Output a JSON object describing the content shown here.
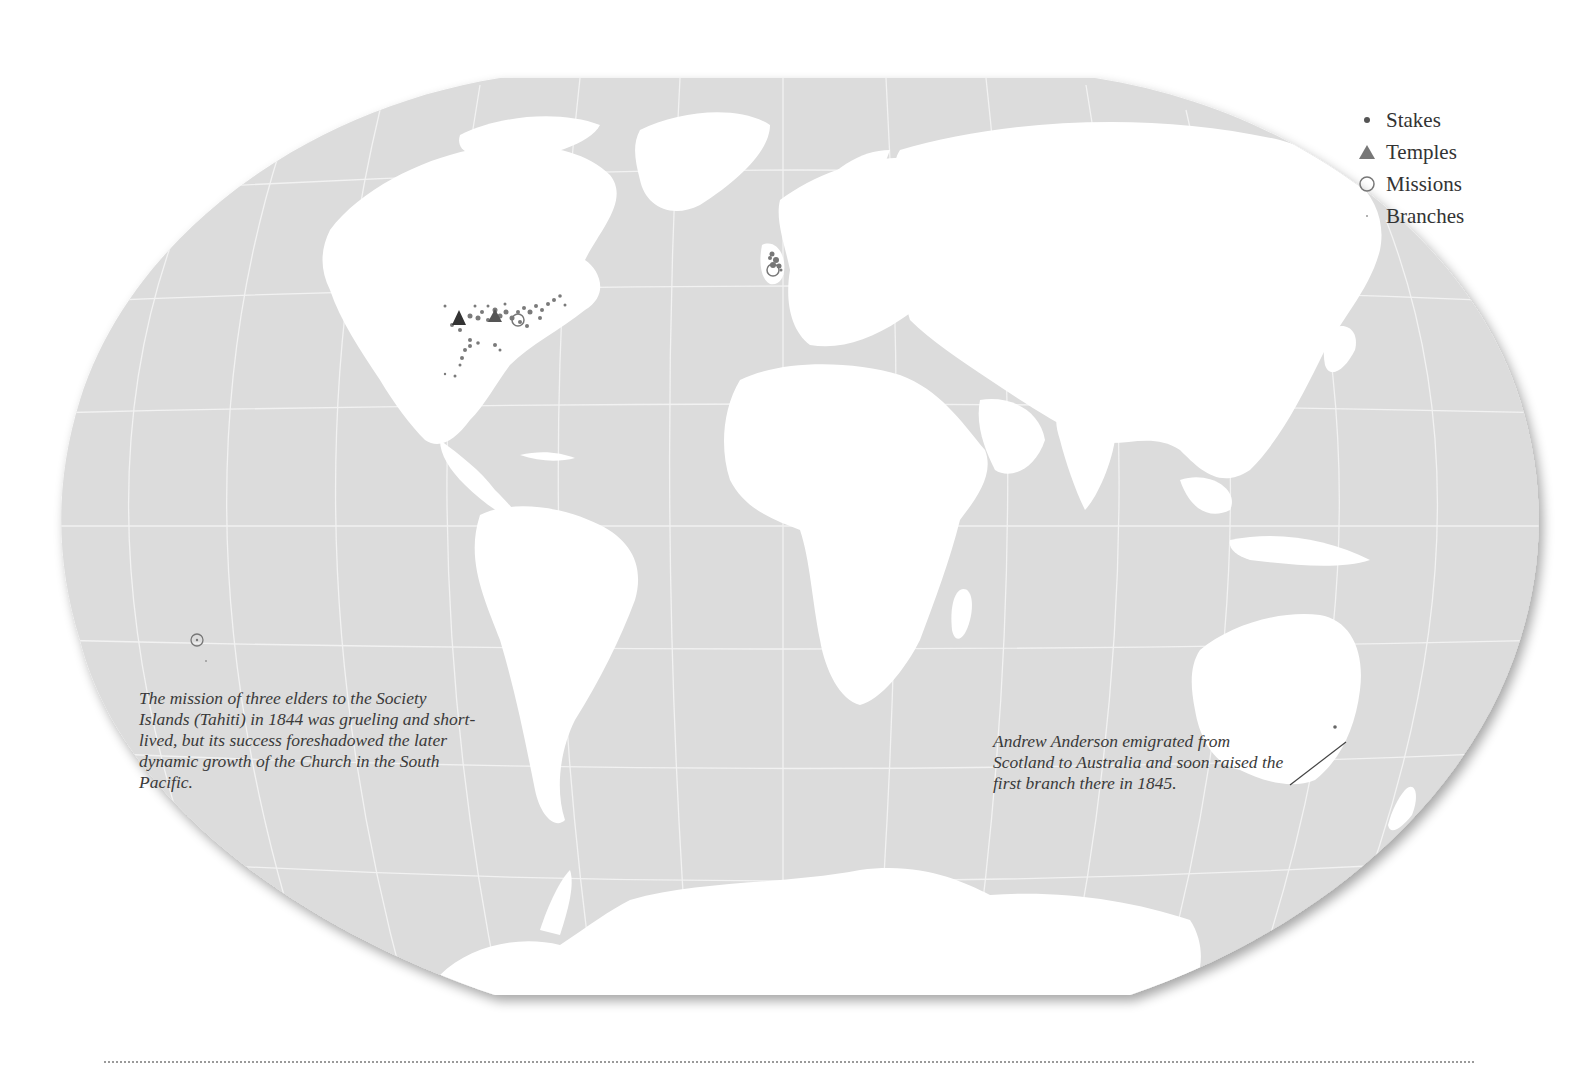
{
  "map": {
    "projection": "winkel-tripel-like",
    "colors": {
      "ocean": "#dcdcdc",
      "land": "#ffffff",
      "graticule": "#f4f4f4",
      "markers": "#6e6e6e",
      "temple": "#3c3c3c"
    }
  },
  "legend": {
    "items": [
      {
        "symbol": "stake-dot-icon",
        "label": "Stakes"
      },
      {
        "symbol": "temple-triangle-icon",
        "label": "Temples"
      },
      {
        "symbol": "mission-circle-icon",
        "label": "Missions"
      },
      {
        "symbol": "branch-dot-icon",
        "label": "Branches"
      }
    ]
  },
  "annotations": {
    "tahiti": "The mission of three elders to the Society Islands (Tahiti) in 1844 was grueling and short-lived, but its success foreshadowed the later dynamic growth of the Church in the South Pacific.",
    "australia": "Andrew Anderson emigrated from Scotland to Australia and soon raised the first branch there in 1845."
  }
}
